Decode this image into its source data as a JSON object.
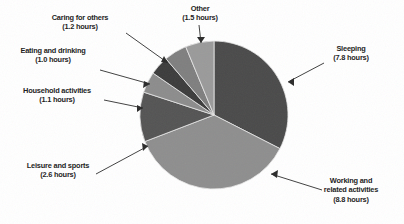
{
  "chart_data": {
    "type": "pie",
    "title": "",
    "subtitle": "",
    "xlabel": "",
    "ylabel": "",
    "units": "hours",
    "total": 24.0,
    "legend_position": "none",
    "grid": false,
    "labels_with_leader_lines": true,
    "start_angle_deg": 0,
    "direction": "clockwise",
    "categories": [
      "Sleeping",
      "Working and related activities",
      "Leisure and sports",
      "Household activities",
      "Eating and drinking",
      "Caring for others",
      "Other"
    ],
    "values": [
      7.8,
      8.8,
      2.6,
      1.1,
      1.0,
      1.2,
      1.5
    ],
    "colors": [
      "#4a4a4a",
      "#8e8e8e",
      "#545454",
      "#8c8c8c",
      "#3c3c3c",
      "#7f7f7f",
      "#9a9a9a"
    ],
    "slices": [
      {
        "name": "Sleeping",
        "value": 7.8,
        "value_text": "7.8 hours",
        "label_line1": "Sleeping",
        "label_line2": "(7.8 hours)",
        "color": "#4a4a4a"
      },
      {
        "name": "Working and related activities",
        "value": 8.8,
        "value_text": "8.8 hours",
        "label_line1": "Working and",
        "label_line2": "related activities",
        "label_line3": "(8.8 hours)",
        "color": "#8e8e8e"
      },
      {
        "name": "Leisure and sports",
        "value": 2.6,
        "value_text": "2.6 hours",
        "label_line1": "Leisure and sports",
        "label_line2": "(2.6 hours)",
        "color": "#545454"
      },
      {
        "name": "Household activities",
        "value": 1.1,
        "value_text": "1.1 hours",
        "label_line1": "Household activities",
        "label_line2": "(1.1 hours)",
        "color": "#8c8c8c"
      },
      {
        "name": "Eating and drinking",
        "value": 1.0,
        "value_text": "1.0 hours",
        "label_line1": "Eating and drinking",
        "label_line2": "(1.0 hours)",
        "color": "#3c3c3c"
      },
      {
        "name": "Caring for others",
        "value": 1.2,
        "value_text": "1.2 hours",
        "label_line1": "Caring for others",
        "label_line2": "(1.2 hours)",
        "color": "#7f7f7f"
      },
      {
        "name": "Other",
        "value": 1.5,
        "value_text": "1.5 hours",
        "label_line1": "Other",
        "label_line2": "(1.5 hours)",
        "color": "#9a9a9a"
      }
    ]
  },
  "labels": {
    "sleeping": "Sleeping\n(7.8 hours)",
    "working": "Working and\nrelated activities\n(8.8 hours)",
    "leisure": "Leisure and sports\n(2.6 hours)",
    "household": "Household activities\n(1.1 hours)",
    "eating": "Eating and drinking\n(1.0 hours)",
    "caring": "Caring for others\n(1.2 hours)",
    "other": "Other\n(1.5 hours)"
  },
  "geometry": {
    "center_x": 214,
    "center_y": 115,
    "radius": 74
  }
}
